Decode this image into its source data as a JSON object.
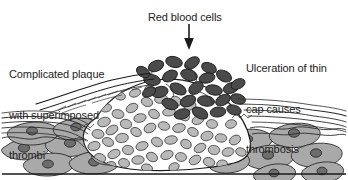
{
  "figure": {
    "type": "medical-illustration",
    "background_color": "#ffffff",
    "width": 348,
    "height": 180
  },
  "labels": {
    "red_blood_cells": "Red blood cells",
    "complicated_plaque_line1": "Complicated plaque",
    "complicated_plaque_line2": "with superimposed",
    "complicated_plaque_line3": "thrombi",
    "ulceration_line1": "Ulceration of thin",
    "ulceration_line2": "cap causes",
    "ulceration_line3": "thrombosis"
  },
  "annotations": {
    "arrow_name": "down-arrow-to-red-blood-cells",
    "arrow_from_x": 189,
    "arrow_from_y": 24,
    "arrow_to_x": 189,
    "arrow_to_y": 48
  },
  "colors": {
    "text": "#1c1c1c",
    "outline": "#1a1a1a",
    "red_blood_cell_fill": "#4a4a4a",
    "red_blood_cell_stroke": "#1f1f1f",
    "foam_cell_fill": "#b9b9b9",
    "foam_cell_stroke": "#3a3a3a",
    "smooth_muscle_fill": "#a9a9a9",
    "smooth_muscle_stroke": "#2a2a2a",
    "nucleus_fill": "#6d6d6d",
    "elastic_lamina": "#2b2b2b",
    "lumen": "#ffffff"
  },
  "structures": [
    {
      "name": "lumen",
      "label": "Arterial lumen"
    },
    {
      "name": "fibrous-cap",
      "label": "Thin fibrous cap (ulcerated)"
    },
    {
      "name": "thrombus",
      "label": "Superimposed thrombus of red blood cells"
    },
    {
      "name": "lipid-core",
      "label": "Lipid / foam cell rich plaque core"
    },
    {
      "name": "internal-elastic-lamina",
      "label": "Internal elastic lamina"
    },
    {
      "name": "media",
      "label": "Media with smooth muscle cells"
    },
    {
      "name": "adventitia-baseline",
      "label": "Outer arterial wall boundary"
    }
  ]
}
